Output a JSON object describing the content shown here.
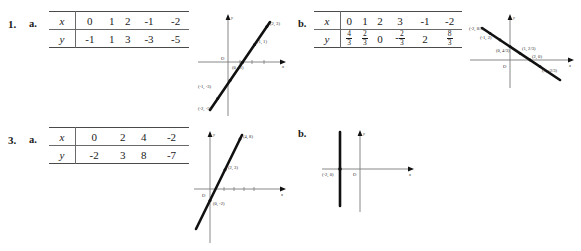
{
  "page": {
    "background": "#ffffff",
    "ink": "#111111"
  },
  "problems": [
    {
      "number": "1.",
      "parts": [
        {
          "label": "a.",
          "table": {
            "row_headers": [
              "x",
              "y"
            ],
            "x_values": [
              "0",
              "1",
              "2",
              "-1",
              "-2"
            ],
            "y_values": [
              "-1",
              "1",
              "3",
              "-3",
              "-5"
            ]
          },
          "graph": {
            "type": "line",
            "x_axis_label": "x",
            "y_axis_label": "y",
            "origin_label": "O",
            "direction": "increasing",
            "points": [
              {
                "x": 2,
                "y": 3,
                "label": "(2, 3)"
              },
              {
                "x": 1,
                "y": 1,
                "label": "(1, 1)"
              },
              {
                "x": 0,
                "y": -1,
                "label": "(0, -1)"
              },
              {
                "x": -1,
                "y": -3,
                "label": "(-1, -3)"
              },
              {
                "x": -2,
                "y": -5,
                "label": "(-2, -5)"
              }
            ]
          }
        },
        {
          "label": "b.",
          "table": {
            "row_headers": [
              "x",
              "y"
            ],
            "x_values": [
              "0",
              "1",
              "2",
              "3",
              "-1",
              "-2"
            ],
            "y_values": [
              {
                "sign": "",
                "num": "4",
                "den": "3"
              },
              {
                "sign": "",
                "num": "2",
                "den": "3"
              },
              {
                "whole": "0"
              },
              {
                "sign": "-",
                "num": "2",
                "den": "3"
              },
              {
                "whole": "2"
              },
              {
                "sign": "",
                "num": "8",
                "den": "3"
              }
            ]
          },
          "graph": {
            "type": "line",
            "x_axis_label": "x",
            "y_axis_label": "y",
            "origin_label": "O",
            "direction": "decreasing",
            "points": [
              {
                "x": -2,
                "y": 2.667,
                "label": "(-2, 8/3)"
              },
              {
                "x": -1,
                "y": 2,
                "label": "(-1, 2)"
              },
              {
                "x": 0,
                "y": 1.333,
                "label": "(0, 4/3)"
              },
              {
                "x": 1,
                "y": 0.667,
                "label": "(1, 2/3)"
              },
              {
                "x": 2,
                "y": 0,
                "label": "(2, 0)"
              },
              {
                "x": 3,
                "y": -0.667,
                "label": "(3, -2/3)"
              }
            ]
          }
        }
      ]
    },
    {
      "number": "3.",
      "parts": [
        {
          "label": "a.",
          "table": {
            "row_headers": [
              "x",
              "y"
            ],
            "x_values": [
              "0",
              "2",
              "4",
              "-2"
            ],
            "y_values": [
              "-2",
              "3",
              "8",
              "-7"
            ]
          },
          "graph": {
            "type": "line",
            "x_axis_label": "x",
            "y_axis_label": "y",
            "origin_label": "O",
            "direction": "increasing",
            "points": [
              {
                "x": 4,
                "y": 8,
                "label": "(4, 8)"
              },
              {
                "x": 2,
                "y": 3,
                "label": "(2, 3)"
              },
              {
                "x": 0,
                "y": -2,
                "label": "(0, -2)"
              }
            ]
          }
        },
        {
          "label": "b.",
          "graph": {
            "type": "vertical-line",
            "x_axis_label": "x",
            "y_axis_label": "y",
            "origin_label": "O",
            "line_at_x": -2,
            "points": [
              {
                "x": -2,
                "y": 0,
                "label": "(-2, 0)"
              }
            ]
          }
        }
      ]
    }
  ]
}
